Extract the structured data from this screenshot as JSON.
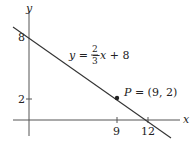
{
  "figure": {
    "axes": {
      "x_label": "x",
      "y_label": "y",
      "x_ticks": [
        {
          "value": 9,
          "label": "9"
        },
        {
          "value": 12,
          "label": "12"
        }
      ],
      "y_ticks": [
        {
          "value": 8,
          "label": "8"
        },
        {
          "value": 2,
          "label": "2"
        }
      ]
    },
    "line": {
      "equation_lhs": "y = −",
      "fraction_num": "2",
      "fraction_den": "3",
      "equation_rhs": "x + 8",
      "slope": "-2/3",
      "intercept": 8
    },
    "point": {
      "name": "P",
      "label": "P = (9, 2)",
      "x": 9,
      "y": 2
    },
    "colors": {
      "axis": "#555555",
      "line": "#333333",
      "text": "#222222"
    }
  }
}
